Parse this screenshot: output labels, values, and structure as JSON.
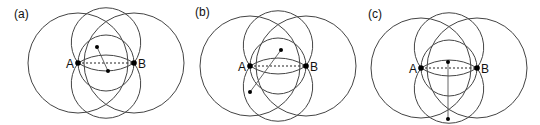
{
  "figure": {
    "width": 540,
    "height": 125,
    "stroke_color": "#444444",
    "dot_color": "#000000",
    "panels": [
      {
        "label": "(a)",
        "label_pos": [
          14,
          18
        ],
        "A": {
          "label": "A",
          "x": 78,
          "y": 63
        },
        "B": {
          "label": "B",
          "x": 134,
          "y": 63
        },
        "big_radius": 50,
        "extra_points": [
          {
            "x": 97,
            "y": 47
          },
          {
            "x": 108,
            "y": 71
          }
        ],
        "segment": [
          [
            97,
            47
          ],
          [
            108,
            71
          ]
        ]
      },
      {
        "label": "(b)",
        "label_pos": [
          195,
          16
        ],
        "A": {
          "label": "A",
          "x": 250,
          "y": 66
        },
        "B": {
          "label": "B",
          "x": 306,
          "y": 66
        },
        "big_radius": 50,
        "extra_points": [
          {
            "x": 281,
            "y": 50
          },
          {
            "x": 250,
            "y": 92
          }
        ],
        "segment": [
          [
            281,
            50
          ],
          [
            250,
            92
          ]
        ]
      },
      {
        "label": "(c)",
        "label_pos": [
          368,
          18
        ],
        "A": {
          "label": "A",
          "x": 421,
          "y": 68
        },
        "B": {
          "label": "B",
          "x": 477,
          "y": 68
        },
        "big_radius": 50,
        "extra_points": [
          {
            "x": 448,
            "y": 62
          },
          {
            "x": 448,
            "y": 119
          }
        ],
        "segment": [
          [
            448,
            62
          ],
          [
            448,
            119
          ]
        ]
      }
    ]
  }
}
